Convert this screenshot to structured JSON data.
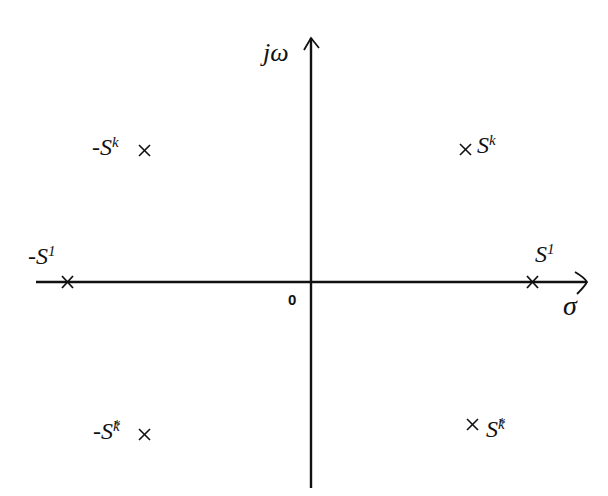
{
  "diagram": {
    "title": "",
    "axes": {
      "vertical_label": "jω",
      "horizontal_label": "σ",
      "origin_label": "0"
    },
    "points": [
      {
        "id": "sk",
        "label": "S",
        "subscript": "k",
        "superscript": "",
        "sign": "",
        "quadrant": "upper-right",
        "marker": "×"
      },
      {
        "id": "neg-sk",
        "label": "S",
        "subscript": "k",
        "superscript": "",
        "sign": "-",
        "quadrant": "upper-left",
        "marker": "×"
      },
      {
        "id": "s1",
        "label": "S",
        "subscript": "1",
        "superscript": "",
        "sign": "",
        "quadrant": "positive-real-axis",
        "marker": "×"
      },
      {
        "id": "neg-s1",
        "label": "S",
        "subscript": "1",
        "superscript": "",
        "sign": "-",
        "quadrant": "negative-real-axis",
        "marker": "×"
      },
      {
        "id": "neg-sk-conj",
        "label": "S",
        "subscript": "k",
        "superscript": "*",
        "sign": "-",
        "quadrant": "lower-left",
        "marker": "×"
      },
      {
        "id": "sk-conj",
        "label": "S",
        "subscript": "k",
        "superscript": "*",
        "sign": "",
        "quadrant": "lower-right",
        "marker": "×"
      }
    ],
    "colors": {
      "line": "#111111",
      "background": "#ffffff"
    }
  }
}
